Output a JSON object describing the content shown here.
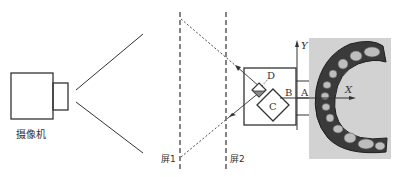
{
  "diagram": {
    "camera_label": "摄像机",
    "screen1_label": "屏1",
    "screen2_label": "屏2",
    "labels": {
      "A": "A",
      "B": "B",
      "C": "C",
      "D": "D",
      "X": "X",
      "Y": "Y"
    },
    "colors": {
      "line": "#333333",
      "photo_bg": "#cfcfcf",
      "teeth_dark": "#2a2a2a",
      "prism_fill": "#888888"
    }
  }
}
